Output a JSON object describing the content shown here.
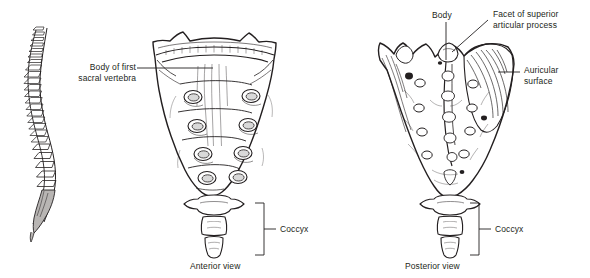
{
  "figure": {
    "ink_color": "#231f20",
    "background_color": "#ffffff",
    "panels": [
      {
        "id": "lateral-spine",
        "name": "lateral-vertebral-column",
        "caption": "",
        "description": "Lateral view of the vertebral column showing cervical, thoracic, lumbar curves with shaded sacrum"
      },
      {
        "id": "anterior-sacrum",
        "name": "sacrum-anterior",
        "caption": "Anterior view",
        "description": "Anterior surface of sacrum with four pairs of anterior sacral foramina and transverse ridges"
      },
      {
        "id": "posterior-sacrum",
        "name": "sacrum-posterior",
        "caption": "Posterior view",
        "description": "Posterior surface of sacrum with median sacral crest and posterior sacral foramina"
      }
    ],
    "labels": {
      "body_of_first_sacral_vertebra": "Body of first\nsacral vertebra",
      "body": "Body",
      "facet_of_superior_articular_process": "Facet of superior\narticular process",
      "auricular_surface": "Auricular\nsurface",
      "coccyx_anterior": "Coccyx",
      "coccyx_posterior": "Coccyx"
    },
    "captions": {
      "anterior": "Anterior view",
      "posterior": "Posterior view"
    }
  }
}
